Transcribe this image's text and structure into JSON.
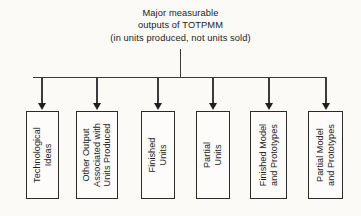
{
  "diagram": {
    "title": {
      "lines": [
        "Major measurable",
        "outputs of TOTPMM",
        "(in units produced, not units sold)"
      ]
    },
    "colors": {
      "background": "#fbfaf7",
      "line": "#3b3b3b",
      "box_border": "#2a2a2a",
      "box_fill": "#fdfcfa",
      "text": "#1b1b1b"
    },
    "nodes": [
      {
        "id": "technological-ideas",
        "lines": [
          "Technological",
          "Ideas"
        ]
      },
      {
        "id": "other-output-associated-with-units-produced",
        "lines": [
          "Other Output",
          "Associated with",
          "Units Produced"
        ]
      },
      {
        "id": "finished-units",
        "lines": [
          "Finished",
          "Units"
        ]
      },
      {
        "id": "partial-units",
        "lines": [
          "Partial",
          "Units"
        ]
      },
      {
        "id": "finished-model-and-prototypes",
        "lines": [
          "Finished Model",
          "and Prototypes"
        ]
      },
      {
        "id": "partial-model-and-prototypes",
        "lines": [
          "Partial Model",
          "and Prototypes"
        ]
      }
    ]
  }
}
